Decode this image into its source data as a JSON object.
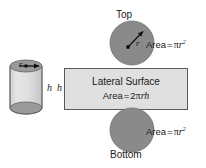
{
  "figure": {
    "background_color": "#ffffff",
    "width": 206,
    "height": 168
  },
  "colors": {
    "circle_fill": "#8a8a8a",
    "circle_stroke": "#6f6f6f",
    "rect_fill": "#e0e0e0",
    "rect_stroke": "#5a5a5a",
    "cylinder_body_fill": "#dcdcdc",
    "cylinder_cap_fill": "#9a9a9a",
    "cylinder_stroke": "#6a6a6a",
    "text_color": "#1a1a1a",
    "arrow_color": "#111111"
  },
  "labels": {
    "top": "Top",
    "bottom": "Bottom",
    "lateral_surface": "Lateral Surface",
    "height_left": "h",
    "height_right": "h",
    "radius_cylinder": "r",
    "radius_top_circle": "r"
  },
  "formulas": {
    "circle_area": {
      "lhs": "Area",
      "eq": "=",
      "pi": "π",
      "variable": "r",
      "exponent": "2",
      "full_text": "Area = πr²"
    },
    "lateral_area": {
      "lhs": "Area",
      "eq": "=",
      "coefficient": "2",
      "pi": "π",
      "variable_r": "r",
      "variable_h": "h",
      "full_text": "Area = 2πrh"
    }
  },
  "shapes": {
    "top_circle": {
      "name": "top-circle",
      "cx": 132,
      "cy": 43,
      "r": 22,
      "has_radius_arrow": true
    },
    "bottom_circle": {
      "name": "bottom-circle",
      "cx": 132,
      "cy": 130,
      "r": 22,
      "has_radius_arrow": false
    },
    "lateral_rect": {
      "name": "lateral-surface-rectangle",
      "x": 64,
      "y": 68,
      "width": 124,
      "height": 42
    },
    "cylinder": {
      "name": "cylinder-3d",
      "cx": 26,
      "top_cy": 66,
      "bottom_cy": 108,
      "rx": 16,
      "ry": 6,
      "has_radius_arrow": true
    }
  },
  "icons": {
    "radius_arrow": "double-headed-arrow",
    "radius_arrow_top": "single-headed-arrow"
  }
}
